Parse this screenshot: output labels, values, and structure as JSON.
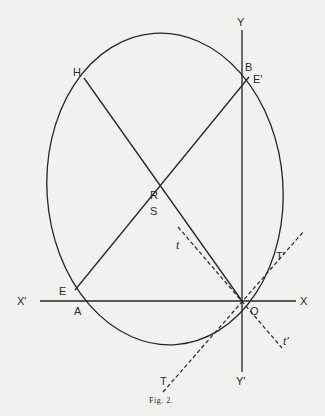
{
  "figure": {
    "caption": "Fig. 2.",
    "labels": {
      "Y": "Y",
      "Y_prime": "Y′",
      "X": "X",
      "X_prime": "X′",
      "B": "B",
      "E_prime": "E′",
      "H": "H",
      "R": "R",
      "S": "S",
      "t": "t",
      "t_prime": "t′",
      "T": "T",
      "T_prime": "T′",
      "E": "E",
      "A": "A",
      "O": "O"
    },
    "stroke_color": "#262626",
    "background_color": "#f1f1ef"
  }
}
